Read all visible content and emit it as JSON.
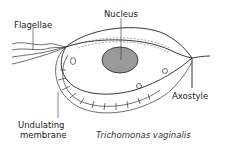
{
  "diagram": {
    "title": "Trichomonas vaginalis",
    "labels": {
      "flagellae": "Flagellae",
      "nucleus": "Nucleus",
      "axostyle": "Axostyle",
      "undulating_membrane_line1": "Undulating",
      "undulating_membrane_line2": "membrane"
    },
    "colors": {
      "line": "#222222",
      "nucleus_fill": "#9a9a9a",
      "background": "#ffffff"
    }
  }
}
